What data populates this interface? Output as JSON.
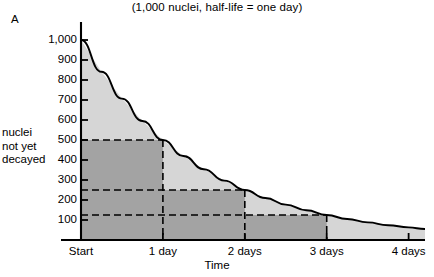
{
  "panel": {
    "label": "A"
  },
  "chart_data": {
    "type": "line",
    "title": "(1,000 nuclei, half-life = one day)",
    "xlabel": "Time",
    "ylabel": "nuclei not yet decayed",
    "ylabel_lines": [
      "nuclei",
      "not yet",
      "decayed"
    ],
    "grid": false,
    "legend": "none",
    "xlim": [
      0,
      4.2
    ],
    "ylim": [
      0,
      1050
    ],
    "x_tick_labels": [
      "Start",
      "1 day",
      "2 days",
      "3 days",
      "4 days"
    ],
    "x_tick_values": [
      0,
      1,
      2,
      3,
      4
    ],
    "y_tick_labels": [
      "100",
      "200",
      "300",
      "400",
      "500",
      "600",
      "700",
      "800",
      "900",
      "1,000"
    ],
    "y_tick_values": [
      100,
      200,
      300,
      400,
      500,
      600,
      700,
      800,
      900,
      1000
    ],
    "series": [
      {
        "name": "nuclei not yet decayed",
        "formula": "1000 * 2^(-t)",
        "x": [
          0,
          0.25,
          0.5,
          0.75,
          1,
          1.25,
          1.5,
          1.75,
          2,
          2.25,
          2.5,
          2.75,
          3,
          3.25,
          3.5,
          3.75,
          4,
          4.2
        ],
        "values": [
          1000,
          841,
          707,
          595,
          500,
          420,
          354,
          297,
          250,
          210,
          177,
          149,
          125,
          105,
          88,
          74,
          63,
          55
        ]
      }
    ],
    "annotations": [
      {
        "label": "half-life 1",
        "x": 1,
        "y": 500,
        "style": "dashed-guide"
      },
      {
        "label": "half-life 2",
        "x": 2,
        "y": 250,
        "style": "dashed-guide"
      },
      {
        "label": "half-life 3",
        "x": 3,
        "y": 125,
        "style": "dashed-guide"
      }
    ],
    "shaded_steps": [
      {
        "from_day": 0,
        "to_day": 1,
        "level": 500
      },
      {
        "from_day": 1,
        "to_day": 2,
        "level": 250
      },
      {
        "from_day": 2,
        "to_day": 3,
        "level": 125
      }
    ],
    "colors": {
      "curve": "#000000",
      "area_light": "#d6d6d6",
      "area_dark": "#a3a3a3",
      "axis": "#000000",
      "dashed": "#000000"
    }
  }
}
